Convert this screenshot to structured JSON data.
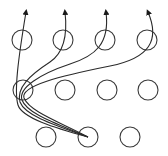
{
  "diagram": {
    "type": "neural-network-connectivity",
    "colors": {
      "background": "#ffffff",
      "stroke": "#2a2a2a"
    },
    "node_radius": 10,
    "layers": [
      {
        "name": "top",
        "nodes": [
          {
            "id": "t1",
            "cx": 22,
            "cy": 40
          },
          {
            "id": "t2",
            "cx": 63,
            "cy": 40
          },
          {
            "id": "t3",
            "cx": 105,
            "cy": 40
          },
          {
            "id": "t4",
            "cx": 147,
            "cy": 40
          }
        ]
      },
      {
        "name": "middle",
        "nodes": [
          {
            "id": "m1",
            "cx": 23,
            "cy": 90
          },
          {
            "id": "m2",
            "cx": 65,
            "cy": 90
          },
          {
            "id": "m3",
            "cx": 107,
            "cy": 90
          },
          {
            "id": "m4",
            "cx": 148,
            "cy": 90
          }
        ]
      },
      {
        "name": "bottom",
        "nodes": [
          {
            "id": "b1",
            "cx": 46,
            "cy": 137
          },
          {
            "id": "b2",
            "cx": 88,
            "cy": 137
          },
          {
            "id": "b3",
            "cx": 130,
            "cy": 137
          }
        ]
      }
    ],
    "edges": [
      {
        "from": "b2",
        "to": "t1-arrow",
        "d": "M88,137 C55,128 22,118 18,105 C14,92 18,60 26,12"
      },
      {
        "from": "b2",
        "to": "t2-arrow",
        "d": "M88,137 C57,126 25,116 20,102 C16,88 30,75 50,62 C62,54 68,38 65,12"
      },
      {
        "from": "b2",
        "to": "t3-arrow",
        "d": "M88,137 C58,124 27,114 22,100 C18,88 40,74 70,64 C95,56 110,44 106,12"
      },
      {
        "from": "b2",
        "to": "t4-arrow",
        "d": "M88,137 C60,122 30,112 24,98 C20,86 60,76 110,66 C150,58 160,40 148,12"
      }
    ],
    "arrows": [
      {
        "x": 26,
        "y": 12
      },
      {
        "x": 65,
        "y": 12
      },
      {
        "x": 106,
        "y": 12
      },
      {
        "x": 148,
        "y": 12
      }
    ]
  }
}
